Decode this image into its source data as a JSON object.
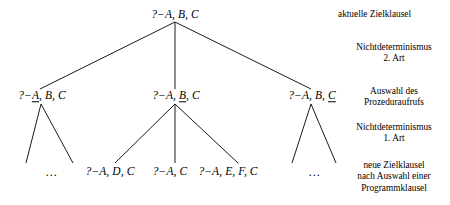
{
  "diagram": {
    "background_color": "#ffffff",
    "line_color": "#1a1a1a",
    "text_color": "#000000",
    "nodes": {
      "root": {
        "prefix": "?−",
        "text_plain": "?−A, B, C",
        "parts_before": "A, B, C",
        "underlined": "",
        "parts_after": ""
      },
      "level2_left": {
        "prefix": "?−",
        "text_plain": "?−A, B, C",
        "parts_before": "",
        "underlined": "A",
        "parts_after": ", B, C"
      },
      "level2_mid": {
        "prefix": "?−",
        "text_plain": "?−A, B, C",
        "parts_before": "A, ",
        "underlined": "B",
        "parts_after": ", C"
      },
      "level2_right": {
        "prefix": "?−",
        "text_plain": "?−A, B, C",
        "parts_before": "A, B, ",
        "underlined": "C",
        "parts_after": ""
      },
      "leaf_left_ellipsis": {
        "text_plain": "…"
      },
      "leaf_1": {
        "text_plain": "?−A, D, C"
      },
      "leaf_2": {
        "text_plain": "?−A, C"
      },
      "leaf_3": {
        "text_plain": "?−A, E, F, C"
      },
      "leaf_right_ellipsis": {
        "text_plain": "…"
      }
    },
    "legend": {
      "row1": "aktuelle Zielklausel",
      "row2_line1": "Nichtdeterminismus",
      "row2_line2": "2. Art",
      "row3_line1": "Auswahl des",
      "row3_line2": "Prozeduraufrufs",
      "row4_line1": "Nichtdeterminismus",
      "row4_line2": "1. Art",
      "row5_line1": "neue Zielklausel",
      "row5_line2": "nach Auswahl einer",
      "row5_line3": "Programmklausel"
    }
  }
}
